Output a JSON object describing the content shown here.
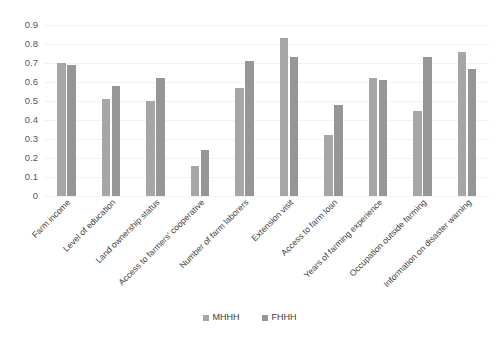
{
  "chart_data": {
    "type": "bar",
    "title": "",
    "subtitle": "",
    "xlabel": "",
    "ylabel": "",
    "ylim": [
      0,
      0.9
    ],
    "ytick_labels": [
      "0.9",
      "0.8",
      "0.7",
      "0.6",
      "0.5",
      "0.4",
      "0.3",
      "0.2",
      "0.1",
      "0"
    ],
    "ytick_values": [
      0.9,
      0.8,
      0.7,
      0.6,
      0.5,
      0.4,
      0.3,
      0.2,
      0.1,
      0
    ],
    "grid": "horizontal",
    "legend_position": "bottom-center",
    "categories": [
      "Farm income",
      "Level of education",
      "Land ownership status",
      "Access to farmers' cooperative",
      "Number of farm laborers",
      "Extension visit",
      "Access to farm loan",
      "Years of farming experience",
      "Occupation outside farming",
      "Information on disaster warning"
    ],
    "series": [
      {
        "name": "MHHH",
        "color": "#a6a6a6",
        "values": [
          0.7,
          0.51,
          0.5,
          0.16,
          0.57,
          0.83,
          0.32,
          0.62,
          0.45,
          0.76
        ]
      },
      {
        "name": "FHHH",
        "color": "#969696",
        "values": [
          0.69,
          0.58,
          0.62,
          0.24,
          0.71,
          0.73,
          0.48,
          0.61,
          0.73,
          0.67
        ]
      }
    ]
  },
  "legend": {
    "items": [
      {
        "label": "MHHH"
      },
      {
        "label": "FHHH"
      }
    ]
  }
}
